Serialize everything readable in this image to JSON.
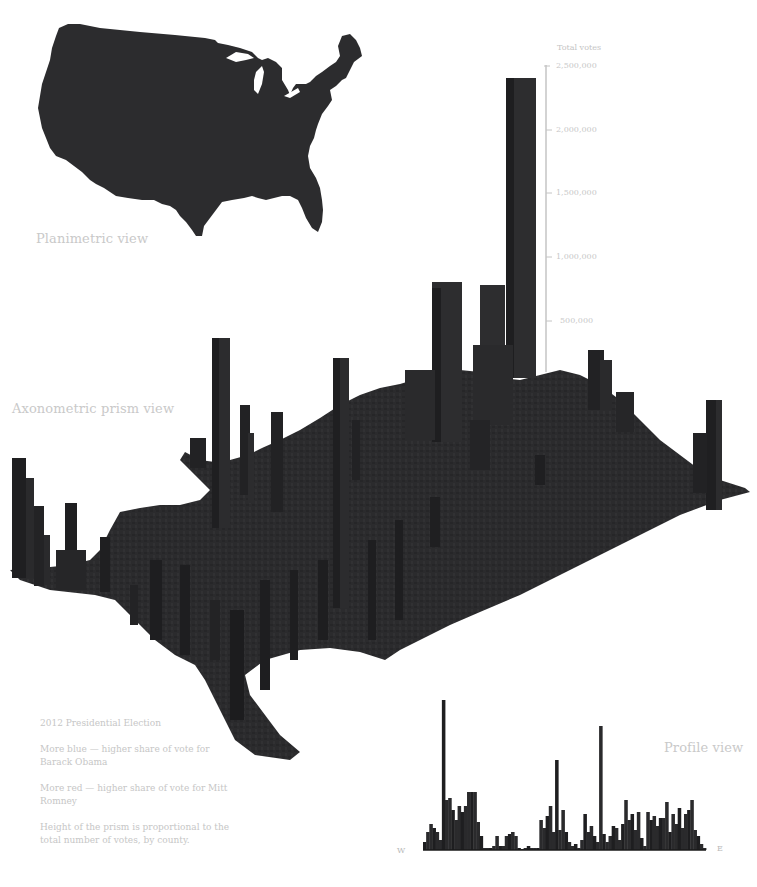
{
  "colors": {
    "prism": "#2b2b2d",
    "prism_dark": "#1c1c1e",
    "prism_light": "#3a3a3c",
    "label": "#c8c8c8",
    "axis": "#c0c0c0"
  },
  "labels": {
    "planimetric": "Planimetric view",
    "axonometric": "Axonometric prism view",
    "profile": "Profile view",
    "west": "W",
    "east": "E"
  },
  "axis": {
    "title": "Total votes",
    "ticks": [
      {
        "label": "2,500,000",
        "value": 2500000
      },
      {
        "label": "2,000,000",
        "value": 2000000
      },
      {
        "label": "1,500,000",
        "value": 1500000
      },
      {
        "label": "1,000,000",
        "value": 1000000
      },
      {
        "label": "500,000",
        "value": 500000
      }
    ]
  },
  "notes": {
    "title": "2012 Presidential Election",
    "blue": "More blue — higher share of vote for Barack Obama",
    "red": "More red — higher share of vote for Mitt Romney",
    "height": "Height of the prism is proportional to the total number of votes, by county."
  },
  "chart_data": [
    {
      "type": "bar",
      "title": "Axonometric prism view",
      "ylabel": "Total votes",
      "ylim": [
        0,
        2500000
      ],
      "yticks": [
        500000,
        1000000,
        1500000,
        2000000,
        2500000
      ],
      "categories": [
        "Los Angeles, CA",
        "Cook, IL",
        "Maricopa, AZ",
        "Harris, TX",
        "San Diego, CA",
        "Orange, CA",
        "Dallas, TX",
        "King, WA",
        "Miami-Dade, FL"
      ],
      "values": [
        3200000,
        2300000,
        1500000,
        1250000,
        1200000,
        1150000,
        1000000,
        950000,
        880000
      ],
      "note": "Prism heights proportional to total votes per county (approximate readings)"
    },
    {
      "type": "bar",
      "title": "Profile view",
      "xlabel": "West to East",
      "x_range": [
        "W",
        "E"
      ],
      "values": [
        8,
        18,
        26,
        22,
        18,
        10,
        150,
        50,
        52,
        40,
        30,
        44,
        38,
        44,
        58,
        58,
        58,
        28,
        14,
        2,
        2,
        2,
        4,
        14,
        4,
        4,
        14,
        16,
        18,
        14,
        2,
        1,
        2,
        4,
        2,
        2,
        2,
        30,
        22,
        34,
        44,
        18,
        90,
        20,
        40,
        18,
        8,
        4,
        6,
        2,
        10,
        36,
        18,
        24,
        14,
        8,
        124,
        16,
        8,
        14,
        24,
        22,
        10,
        26,
        50,
        30,
        36,
        20,
        38,
        12,
        4,
        38,
        30,
        34,
        24,
        32,
        32,
        48,
        18,
        36,
        26,
        42,
        22,
        36,
        40,
        50,
        20,
        14,
        6,
        2
      ],
      "note": "Relative heights of county prisms projected onto the W-E plane (approximate)"
    }
  ]
}
